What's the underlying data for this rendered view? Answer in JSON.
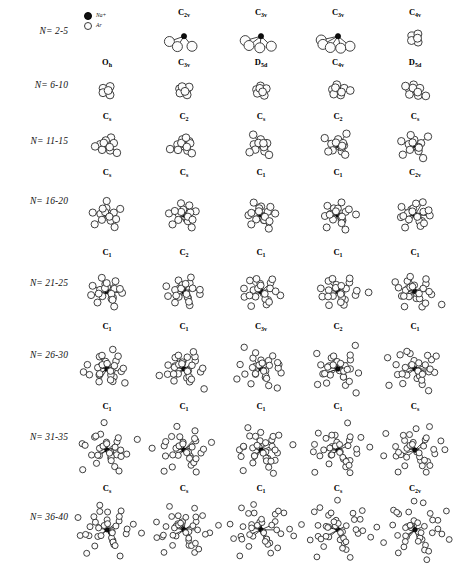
{
  "figure": {
    "legend": {
      "items": [
        {
          "symbol": "cation-dot",
          "label": "Na+"
        },
        {
          "symbol": "neutral-circle",
          "label": "Ar"
        }
      ]
    },
    "colors": {
      "cation": "#0d0d0d",
      "neutral": "#fcfcfc",
      "outline": "#2b2b2b",
      "background": "#ffffff"
    },
    "rows": [
      {
        "label": "N= 2-5",
        "cells": [
          {
            "symmetry": "",
            "sub": "",
            "shown": false
          },
          {
            "symmetry": "C",
            "sub": "2v",
            "shown": true
          },
          {
            "symmetry": "C",
            "sub": "3v",
            "shown": true
          },
          {
            "symmetry": "C",
            "sub": "3v",
            "shown": true
          },
          {
            "symmetry": "C",
            "sub": "4v",
            "shown": true
          }
        ]
      },
      {
        "label": "N= 6-10",
        "cells": [
          {
            "symmetry": "O",
            "sub": "h",
            "shown": true
          },
          {
            "symmetry": "C",
            "sub": "3v",
            "shown": true
          },
          {
            "symmetry": "D",
            "sub": "5d",
            "shown": true
          },
          {
            "symmetry": "C",
            "sub": "4v",
            "shown": true
          },
          {
            "symmetry": "D",
            "sub": "5d",
            "shown": true
          }
        ]
      },
      {
        "label": "N= 11-15",
        "cells": [
          {
            "symmetry": "C",
            "sub": "s",
            "shown": true
          },
          {
            "symmetry": "C",
            "sub": "2",
            "shown": true
          },
          {
            "symmetry": "C",
            "sub": "s",
            "shown": true
          },
          {
            "symmetry": "C",
            "sub": "2",
            "shown": true
          },
          {
            "symmetry": "C",
            "sub": "s",
            "shown": true
          }
        ]
      },
      {
        "label": "N= 16-20",
        "cells": [
          {
            "symmetry": "C",
            "sub": "s",
            "shown": true
          },
          {
            "symmetry": "C",
            "sub": "s",
            "shown": true
          },
          {
            "symmetry": "C",
            "sub": "1",
            "shown": true
          },
          {
            "symmetry": "C",
            "sub": "1",
            "shown": true
          },
          {
            "symmetry": "C",
            "sub": "2v",
            "shown": true
          }
        ]
      },
      {
        "label": "N= 21-25",
        "cells": [
          {
            "symmetry": "C",
            "sub": "1",
            "shown": true
          },
          {
            "symmetry": "C",
            "sub": "2",
            "shown": true
          },
          {
            "symmetry": "C",
            "sub": "1",
            "shown": true
          },
          {
            "symmetry": "C",
            "sub": "1",
            "shown": true
          },
          {
            "symmetry": "C",
            "sub": "1",
            "shown": true
          }
        ]
      },
      {
        "label": "N= 26-30",
        "cells": [
          {
            "symmetry": "C",
            "sub": "1",
            "shown": true
          },
          {
            "symmetry": "C",
            "sub": "1",
            "shown": true
          },
          {
            "symmetry": "C",
            "sub": "3v",
            "shown": true
          },
          {
            "symmetry": "C",
            "sub": "2",
            "shown": true
          },
          {
            "symmetry": "C",
            "sub": "1",
            "shown": true
          }
        ]
      },
      {
        "label": "N= 31-35",
        "cells": [
          {
            "symmetry": "C",
            "sub": "1",
            "shown": true
          },
          {
            "symmetry": "C",
            "sub": "1",
            "shown": true
          },
          {
            "symmetry": "C",
            "sub": "1",
            "shown": true
          },
          {
            "symmetry": "C",
            "sub": "1",
            "shown": true
          },
          {
            "symmetry": "C",
            "sub": "s",
            "shown": true
          }
        ]
      },
      {
        "label": "N= 36-40",
        "cells": [
          {
            "symmetry": "C",
            "sub": "s",
            "shown": true
          },
          {
            "symmetry": "C",
            "sub": "s",
            "shown": true
          },
          {
            "symmetry": "C",
            "sub": "1",
            "shown": true
          },
          {
            "symmetry": "C",
            "sub": "s",
            "shown": true
          },
          {
            "symmetry": "C",
            "sub": "2v",
            "shown": true
          }
        ]
      }
    ]
  }
}
